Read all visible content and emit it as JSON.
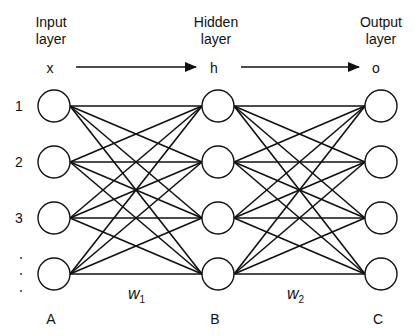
{
  "diagram": {
    "layers": [
      {
        "key": "input",
        "header_line1": "Input",
        "header_line2": "layer",
        "symbol": "x",
        "letter": "A",
        "x": 54
      },
      {
        "key": "hidden",
        "header_line1": "Hidden",
        "header_line2": "layer",
        "symbol": "h",
        "letter": "B",
        "x": 218
      },
      {
        "key": "output",
        "header_line1": "Output",
        "header_line2": "layer",
        "symbol": "o",
        "letter": "C",
        "x": 381
      }
    ],
    "node_rows_y": [
      106,
      162,
      218,
      274
    ],
    "node_radius": 16,
    "row_labels": [
      "1",
      "2",
      "3"
    ],
    "ellipsis_dots": [
      "·",
      "·",
      "·"
    ],
    "weights": [
      {
        "name": "w",
        "subscript": "1"
      },
      {
        "name": "w",
        "subscript": "2"
      }
    ],
    "arrows": [
      {
        "from": "x",
        "to": "h",
        "x1": 76,
        "x2": 196,
        "y": 67
      },
      {
        "from": "h",
        "to": "o",
        "x1": 241,
        "x2": 359,
        "y": 67
      }
    ],
    "colors": {
      "stroke": "#111111",
      "background": "#ffffff"
    }
  }
}
